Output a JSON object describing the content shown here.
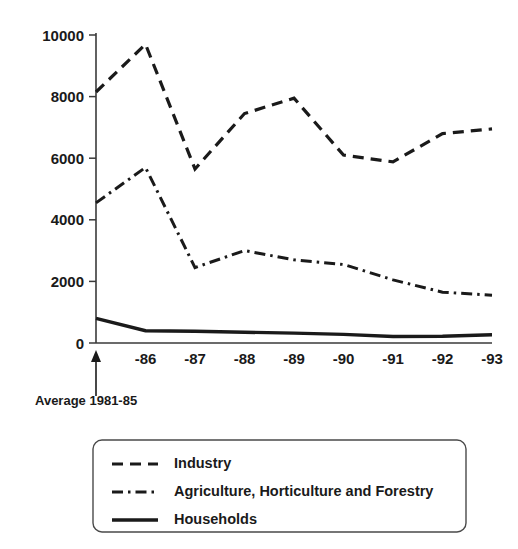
{
  "chart_data": {
    "type": "line",
    "title": "",
    "xlabel": "",
    "ylabel": "",
    "ylim": [
      0,
      10000
    ],
    "yticks": [
      0,
      2000,
      4000,
      6000,
      8000,
      10000
    ],
    "ytick_labels": [
      "0",
      "2000",
      "4000",
      "6000",
      "8000",
      "10000"
    ],
    "grid": false,
    "legend_position": "below-plot",
    "categories": [
      "Average 1981-85",
      "-86",
      "-87",
      "-88",
      "-89",
      "-90",
      "-91",
      "-92",
      "-93"
    ],
    "xtick_labels": [
      "",
      "-86",
      "-87",
      "-88",
      "-89",
      "-90",
      "-91",
      "-92",
      "-93"
    ],
    "annotations": [
      {
        "text": "Average 1981-85",
        "target_category": "Average 1981-85",
        "marker": "up-arrow"
      }
    ],
    "series": [
      {
        "name": "Industry",
        "style": "dashed",
        "values": [
          8150,
          9700,
          5650,
          7450,
          7950,
          6100,
          5880,
          6800,
          6950
        ]
      },
      {
        "name": "Agriculture, Horticulture and Forestry",
        "style": "dash-dot",
        "values": [
          4550,
          5700,
          2450,
          3000,
          2700,
          2550,
          2050,
          1650,
          1550
        ]
      },
      {
        "name": "Households",
        "style": "solid",
        "values": [
          800,
          400,
          380,
          350,
          320,
          280,
          210,
          220,
          270
        ]
      }
    ]
  },
  "legend": {
    "items": [
      {
        "label": "Industry",
        "style": "dashed"
      },
      {
        "label": "Agriculture, Horticulture and Forestry",
        "style": "dash-dot"
      },
      {
        "label": "Households",
        "style": "solid"
      }
    ]
  },
  "colors": {
    "ink": "#1a1a1a",
    "axis": "#3a3a3a",
    "background": "#ffffff"
  }
}
